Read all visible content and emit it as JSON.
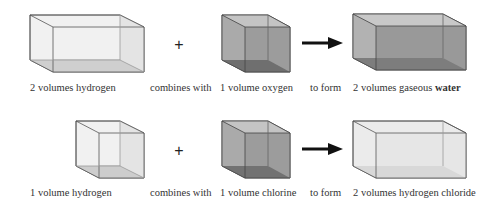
{
  "rows": [
    {
      "reactant1": "2 volumes hydrogen",
      "connector1": "combines with",
      "reactant2": "1 volume oxygen",
      "connector2": "to form",
      "product_prefix": "2 volumes gaseous",
      "product_emphasis": "water",
      "plus": "+"
    },
    {
      "reactant1": "1 volume hydrogen",
      "connector1": "combines with",
      "reactant2": "1 volume chlorine",
      "connector2": "to form",
      "product": "2 volumes hydrogen chloride",
      "plus": "+"
    }
  ],
  "colors": {
    "light_box": "#ececec",
    "dark_box": "#9a9a9a",
    "edge": "#444444",
    "arrow": "#111111"
  }
}
